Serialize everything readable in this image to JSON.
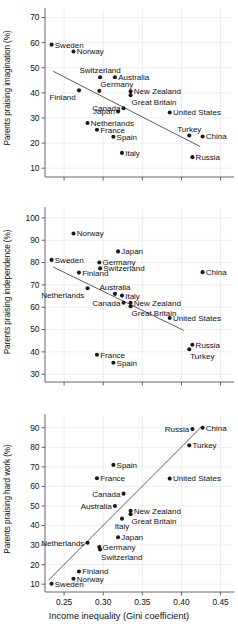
{
  "figure": {
    "width": 238,
    "height": 626,
    "background": "#ffffff",
    "point_color": "#1a1a1a",
    "line_color": "#555555",
    "axis_color": "#555555",
    "grid_color": "#e9e9e9",
    "xlabel": "Income inequality (Gini coefficient)",
    "x_ticks": [
      0.25,
      0.3,
      0.35,
      0.4,
      0.45
    ],
    "x_tick_labels": [
      "0.25",
      "0.30",
      "0.35",
      "0.40",
      "0.45"
    ],
    "xlim": [
      0.2256,
      0.4646
    ]
  },
  "chart_data": [
    {
      "type": "scatter",
      "title": "",
      "xlabel": "",
      "ylabel": "Parents praising imagination (%)",
      "xlim": [
        0.2256,
        0.4646
      ],
      "ylim": [
        6.5,
        73.0
      ],
      "y_ticks": [
        10,
        20,
        30,
        40,
        50,
        60,
        70
      ],
      "y_tick_labels": [
        "10",
        "20",
        "30",
        "40",
        "50",
        "60",
        "70"
      ],
      "grid": true,
      "legend": "none",
      "trendline": {
        "x1": 0.236,
        "y1": 48.6,
        "x2": 0.424,
        "y2": 18.6
      },
      "points": [
        {
          "label": "Sweden",
          "x": 0.234,
          "y": 59.2,
          "label_pos": "right"
        },
        {
          "label": "Norway",
          "x": 0.262,
          "y": 56.5,
          "label_pos": "right"
        },
        {
          "label": "Switzerland",
          "x": 0.296,
          "y": 46.2,
          "label_pos": "above"
        },
        {
          "label": "Australia",
          "x": 0.315,
          "y": 46.2,
          "label_pos": "right"
        },
        {
          "label": "Finland",
          "x": 0.269,
          "y": 41.0,
          "label_pos": "below-left"
        },
        {
          "label": "Germany",
          "x": 0.295,
          "y": 40.8,
          "label_pos": "above-right"
        },
        {
          "label": "New Zealand",
          "x": 0.335,
          "y": 40.6,
          "label_pos": "right"
        },
        {
          "label": "Great Britain",
          "x": 0.335,
          "y": 39.1,
          "label_pos": "below-right"
        },
        {
          "label": "Canada",
          "x": 0.326,
          "y": 33.9,
          "label_pos": "left"
        },
        {
          "label": "Japan",
          "x": 0.319,
          "y": 32.6,
          "label_pos": "left"
        },
        {
          "label": "United States",
          "x": 0.385,
          "y": 32.2,
          "label_pos": "right"
        },
        {
          "label": "Netherlands",
          "x": 0.28,
          "y": 28.0,
          "label_pos": "right"
        },
        {
          "label": "France",
          "x": 0.292,
          "y": 25.3,
          "label_pos": "right"
        },
        {
          "label": "Turkey",
          "x": 0.41,
          "y": 23.0,
          "label_pos": "above"
        },
        {
          "label": "China",
          "x": 0.427,
          "y": 22.6,
          "label_pos": "right"
        },
        {
          "label": "Spain",
          "x": 0.313,
          "y": 22.5,
          "label_pos": "right"
        },
        {
          "label": "Italy",
          "x": 0.324,
          "y": 16.1,
          "label_pos": "right"
        },
        {
          "label": "Russia",
          "x": 0.414,
          "y": 14.4,
          "label_pos": "right"
        }
      ]
    },
    {
      "type": "scatter",
      "title": "",
      "xlabel": "",
      "ylabel": "Parents praising independence (%)",
      "xlim": [
        0.2256,
        0.4646
      ],
      "ylim": [
        26.5,
        104.0
      ],
      "y_ticks": [
        30,
        40,
        50,
        60,
        70,
        80,
        90,
        100
      ],
      "y_tick_labels": [
        "30",
        "40",
        "50",
        "60",
        "70",
        "80",
        "90",
        "100"
      ],
      "grid": true,
      "legend": "none",
      "trendline": {
        "x1": 0.236,
        "y1": 78.0,
        "x2": 0.403,
        "y2": 49.6
      },
      "points": [
        {
          "label": "Norway",
          "x": 0.262,
          "y": 93.0,
          "label_pos": "right"
        },
        {
          "label": "Japan",
          "x": 0.319,
          "y": 85.0,
          "label_pos": "right"
        },
        {
          "label": "Sweden",
          "x": 0.234,
          "y": 81.2,
          "label_pos": "right"
        },
        {
          "label": "Germany",
          "x": 0.295,
          "y": 80.0,
          "label_pos": "right"
        },
        {
          "label": "Switzerland",
          "x": 0.296,
          "y": 77.4,
          "label_pos": "right"
        },
        {
          "label": "Finland",
          "x": 0.269,
          "y": 75.5,
          "label_pos": "right"
        },
        {
          "label": "China",
          "x": 0.427,
          "y": 75.7,
          "label_pos": "right"
        },
        {
          "label": "Netherlands",
          "x": 0.28,
          "y": 68.5,
          "label_pos": "below-left"
        },
        {
          "label": "Australia",
          "x": 0.315,
          "y": 66.0,
          "label_pos": "above"
        },
        {
          "label": "Italy",
          "x": 0.324,
          "y": 65.2,
          "label_pos": "right"
        },
        {
          "label": "Canada",
          "x": 0.326,
          "y": 62.0,
          "label_pos": "left"
        },
        {
          "label": "New Zealand",
          "x": 0.335,
          "y": 62.0,
          "label_pos": "right"
        },
        {
          "label": "Great Britain",
          "x": 0.335,
          "y": 60.4,
          "label_pos": "below-right"
        },
        {
          "label": "United States",
          "x": 0.385,
          "y": 55.2,
          "label_pos": "right"
        },
        {
          "label": "Russia",
          "x": 0.414,
          "y": 43.2,
          "label_pos": "right"
        },
        {
          "label": "Turkey",
          "x": 0.41,
          "y": 41.2,
          "label_pos": "below-right"
        },
        {
          "label": "France",
          "x": 0.292,
          "y": 38.7,
          "label_pos": "right"
        },
        {
          "label": "Spain",
          "x": 0.313,
          "y": 35.1,
          "label_pos": "right"
        }
      ]
    },
    {
      "type": "scatter",
      "title": "",
      "xlabel": "Income inequality (Gini coefficient)",
      "ylabel": "Parents praising hard work (%)",
      "xlim": [
        0.2256,
        0.4646
      ],
      "ylim": [
        6.0,
        96.0
      ],
      "y_ticks": [
        10,
        20,
        30,
        40,
        50,
        60,
        70,
        80,
        90
      ],
      "y_tick_labels": [
        "10",
        "20",
        "30",
        "40",
        "50",
        "60",
        "70",
        "80",
        "90"
      ],
      "grid": true,
      "legend": "none",
      "trendline": {
        "x1": 0.23,
        "y1": 12.0,
        "x2": 0.427,
        "y2": 91.0
      },
      "points": [
        {
          "label": "China",
          "x": 0.427,
          "y": 90.0,
          "label_pos": "right"
        },
        {
          "label": "Russia",
          "x": 0.414,
          "y": 89.3,
          "label_pos": "left"
        },
        {
          "label": "Turkey",
          "x": 0.41,
          "y": 81.0,
          "label_pos": "right"
        },
        {
          "label": "Spain",
          "x": 0.313,
          "y": 71.0,
          "label_pos": "right"
        },
        {
          "label": "France",
          "x": 0.292,
          "y": 64.2,
          "label_pos": "right"
        },
        {
          "label": "United States",
          "x": 0.385,
          "y": 64.0,
          "label_pos": "right"
        },
        {
          "label": "Canada",
          "x": 0.326,
          "y": 56.3,
          "label_pos": "left"
        },
        {
          "label": "Australia",
          "x": 0.315,
          "y": 50.0,
          "label_pos": "left"
        },
        {
          "label": "New Zealand",
          "x": 0.335,
          "y": 47.5,
          "label_pos": "right"
        },
        {
          "label": "Great Britain",
          "x": 0.335,
          "y": 45.8,
          "label_pos": "below-right"
        },
        {
          "label": "Italy",
          "x": 0.324,
          "y": 43.5,
          "label_pos": "below"
        },
        {
          "label": "Japan",
          "x": 0.319,
          "y": 34.0,
          "label_pos": "right"
        },
        {
          "label": "Netherlands",
          "x": 0.28,
          "y": 31.2,
          "label_pos": "left"
        },
        {
          "label": "Germany",
          "x": 0.295,
          "y": 29.0,
          "label_pos": "right"
        },
        {
          "label": "Switzerland",
          "x": 0.296,
          "y": 27.7,
          "label_pos": "below-right"
        },
        {
          "label": "Finland",
          "x": 0.269,
          "y": 16.5,
          "label_pos": "right"
        },
        {
          "label": "Norway",
          "x": 0.262,
          "y": 12.8,
          "label_pos": "right"
        },
        {
          "label": "Sweden",
          "x": 0.234,
          "y": 10.2,
          "label_pos": "right"
        }
      ]
    }
  ]
}
